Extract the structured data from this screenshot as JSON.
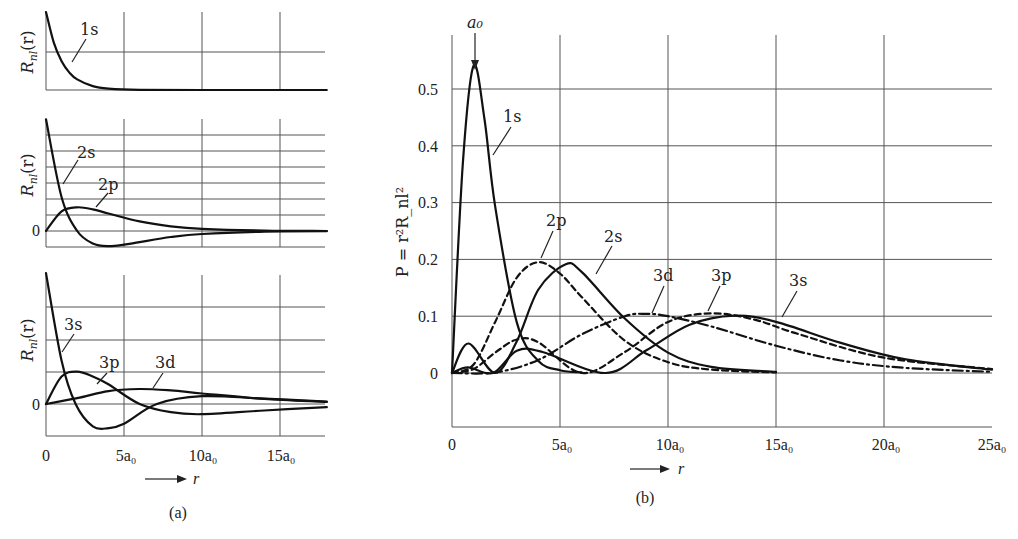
{
  "panel_a": {
    "caption": "(a)",
    "ylabel": "R_nl(r)",
    "ylabel_main": "R",
    "ylabel_sub": "nl",
    "ylabel_arg": "(r)",
    "zero_label": "0",
    "x_ticks": [
      "0",
      "5a₀",
      "10a₀",
      "15a₀"
    ],
    "x_arrow_label": "r",
    "subplots": [
      {
        "labels": [
          "1s"
        ]
      },
      {
        "labels": [
          "2s",
          "2p"
        ]
      },
      {
        "labels": [
          "3s",
          "3p",
          "3d"
        ]
      }
    ]
  },
  "panel_b": {
    "caption": "(b)",
    "ylabel": "P = r²R_nl²",
    "peak_annotation": "a₀",
    "y_ticks": [
      "0.5",
      "0.4",
      "0.3",
      "0.2",
      "0.1",
      "0"
    ],
    "x_ticks": [
      "0",
      "5a₀",
      "10a₀",
      "15a₀",
      "20a₀",
      "25a₀"
    ],
    "x_arrow_label": "r",
    "curve_labels": [
      "1s",
      "2p",
      "2s",
      "3d",
      "3p",
      "3s"
    ]
  },
  "chart_data": [
    {
      "type": "line",
      "title": "(a) Radial wavefunctions R_nl(r) of hydrogen",
      "xlabel": "r",
      "ylabel": "R_nl(r)",
      "x_unit": "a0",
      "xlim": [
        0,
        18
      ],
      "x_ticks": [
        0,
        5,
        10,
        15
      ],
      "grid": true,
      "subplots": [
        {
          "series": [
            {
              "name": "1s",
              "style": "solid",
              "x": [
                0,
                0.5,
                1,
                1.5,
                2,
                3,
                4,
                6,
                10,
                18
              ],
              "y": [
                2.0,
                1.213,
                0.736,
                0.446,
                0.271,
                0.1,
                0.037,
                0.005,
                0.0,
                0.0
              ]
            }
          ]
        },
        {
          "series": [
            {
              "name": "2s",
              "style": "solid",
              "x": [
                0,
                1,
                2,
                3,
                4,
                5,
                6,
                8,
                10,
                14,
                18
              ],
              "y": [
                0.707,
                0.214,
                0.0,
                -0.079,
                -0.096,
                -0.087,
                -0.07,
                -0.038,
                -0.019,
                -0.004,
                -0.001
              ]
            },
            {
              "name": "2p",
              "style": "solid",
              "x": [
                0,
                1,
                2,
                3,
                4,
                6,
                8,
                10,
                14,
                18
              ],
              "y": [
                0.0,
                0.124,
                0.15,
                0.137,
                0.111,
                0.061,
                0.03,
                0.014,
                0.003,
                0.0
              ]
            }
          ]
        },
        {
          "series": [
            {
              "name": "3s",
              "style": "solid",
              "x": [
                0,
                1,
                1.9,
                3,
                4,
                5,
                7.1,
                10,
                14,
                18
              ],
              "y": [
                0.385,
                0.127,
                0.0,
                -0.066,
                -0.071,
                -0.058,
                0.0,
                0.023,
                0.016,
                0.007
              ]
            },
            {
              "name": "3p",
              "style": "solid",
              "x": [
                0,
                1,
                2,
                3,
                4,
                6,
                8,
                10,
                14,
                18
              ],
              "y": [
                0.0,
                0.081,
                0.095,
                0.081,
                0.058,
                0.0,
                -0.024,
                -0.03,
                -0.019,
                -0.009
              ]
            },
            {
              "name": "3d",
              "style": "solid",
              "x": [
                0,
                2,
                4,
                6,
                8,
                10,
                14,
                18
              ],
              "y": [
                0.0,
                0.017,
                0.038,
                0.044,
                0.04,
                0.031,
                0.015,
                0.006
              ]
            }
          ]
        }
      ]
    },
    {
      "type": "line",
      "title": "(b) Radial probability density P = r²R_nl²",
      "xlabel": "r",
      "ylabel": "P = r²R_nl²",
      "x_unit": "a0",
      "xlim": [
        0,
        25
      ],
      "ylim": [
        -0.1,
        0.6
      ],
      "x_ticks": [
        0,
        5,
        10,
        15,
        20,
        25
      ],
      "y_ticks": [
        0,
        0.1,
        0.2,
        0.3,
        0.4,
        0.5
      ],
      "grid": true,
      "annotations": [
        {
          "text": "a₀",
          "x": 1,
          "y": 0.541,
          "arrow": "down"
        }
      ],
      "series": [
        {
          "name": "1s",
          "style": "solid",
          "x": [
            0,
            0.5,
            1,
            1.5,
            2,
            3,
            4,
            5,
            6
          ],
          "y": [
            0,
            0.368,
            0.541,
            0.448,
            0.293,
            0.089,
            0.021,
            0.005,
            0.001
          ]
        },
        {
          "name": "2s",
          "style": "solid",
          "x": [
            0,
            0.76,
            2,
            3,
            4,
            5.24,
            6,
            8,
            10,
            12,
            15
          ],
          "y": [
            0,
            0.052,
            0,
            0.056,
            0.147,
            0.191,
            0.178,
            0.096,
            0.036,
            0.011,
            0.002
          ]
        },
        {
          "name": "2p",
          "style": "dashed",
          "x": [
            0,
            1,
            2,
            3,
            4,
            5,
            6,
            8,
            10,
            12,
            15
          ],
          "y": [
            0,
            0.015,
            0.09,
            0.168,
            0.195,
            0.175,
            0.134,
            0.057,
            0.019,
            0.006,
            0.001
          ]
        },
        {
          "name": "3s",
          "style": "solid",
          "x": [
            0,
            0.74,
            1.9,
            3,
            4.19,
            7.1,
            9,
            11,
            13.07,
            15,
            18,
            21,
            25
          ],
          "y": [
            0,
            0.01,
            0,
            0.039,
            0.037,
            0,
            0.04,
            0.085,
            0.101,
            0.09,
            0.053,
            0.024,
            0.006
          ]
        },
        {
          "name": "3p",
          "style": "dashed",
          "x": [
            0,
            1,
            2,
            3,
            4,
            6,
            8,
            10,
            12,
            14,
            16,
            20,
            25
          ],
          "y": [
            0,
            0.007,
            0.036,
            0.059,
            0.054,
            0,
            0.037,
            0.09,
            0.105,
            0.094,
            0.069,
            0.027,
            0.007
          ]
        },
        {
          "name": "3d",
          "style": "dashdot",
          "x": [
            0,
            2,
            4,
            6,
            8,
            9,
            10,
            12,
            15,
            18,
            21,
            25
          ],
          "y": [
            0,
            0.001,
            0.023,
            0.068,
            0.1,
            0.104,
            0.1,
            0.082,
            0.048,
            0.022,
            0.009,
            0.002
          ]
        }
      ]
    }
  ]
}
